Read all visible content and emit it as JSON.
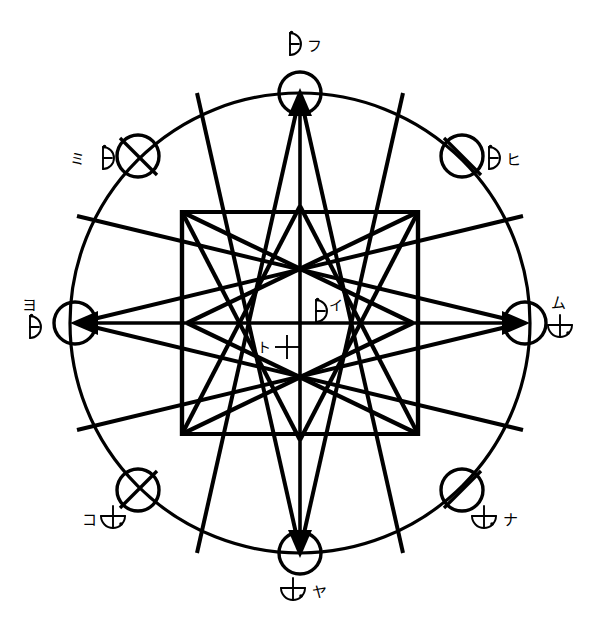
{
  "figure": {
    "style": {
      "ink_color": "#000000",
      "background_color": "#ffffff"
    },
    "geometry": {
      "center_x": 300,
      "center_y": 323,
      "outer_radius": 230,
      "node_radius": 21,
      "star_outer_radius": 153,
      "star_point_count": 8
    }
  },
  "nodes": [
    {
      "id": "north",
      "position": "top",
      "angle_deg": 90,
      "cx": 300,
      "cy": 93,
      "has_arrow": true,
      "arrow_direction": "up",
      "line_through": false,
      "label": {
        "symbol": "half-moon-with-dot",
        "kana": "フ",
        "order": "symbol-then-kana",
        "x": 300,
        "y": 42
      }
    },
    {
      "id": "northeast",
      "position": "upper-right",
      "angle_deg": 45,
      "cx": 462,
      "cy": 156,
      "has_arrow": false,
      "arrow_direction": null,
      "line_through": true,
      "label": {
        "symbol": "half-moon-with-dot",
        "kana": "ヒ",
        "order": "symbol-then-kana",
        "x": 500,
        "y": 158
      }
    },
    {
      "id": "east",
      "position": "right",
      "angle_deg": 0,
      "cx": 525,
      "cy": 323,
      "has_arrow": true,
      "arrow_direction": "right",
      "line_through": false,
      "label": {
        "symbol": "cup-with-dot",
        "kana": "ム",
        "order": "kana-above-symbol",
        "x": 560,
        "y": 310
      }
    },
    {
      "id": "southeast",
      "position": "lower-right",
      "angle_deg": -45,
      "cx": 462,
      "cy": 490,
      "has_arrow": false,
      "arrow_direction": null,
      "line_through": true,
      "label": {
        "symbol": "cup-with-dot",
        "kana": "ナ",
        "order": "symbol-then-kana",
        "x": 492,
        "y": 522
      }
    },
    {
      "id": "south",
      "position": "bottom",
      "angle_deg": -90,
      "cx": 300,
      "cy": 553,
      "has_arrow": true,
      "arrow_direction": "down",
      "line_through": false,
      "label": {
        "symbol": "cup-with-dot",
        "kana": "ヤ",
        "order": "symbol-then-kana",
        "x": 300,
        "y": 592
      }
    },
    {
      "id": "southwest",
      "position": "lower-left",
      "angle_deg": -135,
      "cx": 138,
      "cy": 490,
      "has_arrow": false,
      "arrow_direction": null,
      "line_through": true,
      "label": {
        "symbol": "cup-with-dot",
        "kana": "コ",
        "order": "kana-then-symbol",
        "x": 90,
        "y": 522
      }
    },
    {
      "id": "west",
      "position": "left",
      "angle_deg": 180,
      "cx": 75,
      "cy": 323,
      "has_arrow": true,
      "arrow_direction": "left",
      "line_through": false,
      "label": {
        "symbol": "half-moon-with-dot",
        "kana": "ヨ",
        "order": "kana-above-symbol",
        "x": 30,
        "y": 310
      }
    },
    {
      "id": "northwest",
      "position": "upper-left",
      "angle_deg": 135,
      "cx": 138,
      "cy": 156,
      "has_arrow": false,
      "arrow_direction": null,
      "line_through": true,
      "label": {
        "symbol": "half-moon-with-dot",
        "kana": "ミ",
        "order": "kana-then-symbol",
        "x": 78,
        "y": 158
      }
    }
  ],
  "center_labels": [
    {
      "id": "center-upper",
      "symbol": "half-moon-with-dot",
      "kana": "イ",
      "order": "symbol-then-kana",
      "x": 318,
      "y": 309
    },
    {
      "id": "center-lower",
      "symbol": "cross-plus",
      "kana": "ト",
      "order": "kana-then-symbol",
      "x": 262,
      "y": 348
    }
  ],
  "legend": {
    "symbols": [
      {
        "name": "half-moon-with-dot",
        "description": "Vertical bar with right-facing semicircle and small dot at top"
      },
      {
        "name": "cup-with-dot",
        "description": "Vertical bar through a downward bowl with a small dot"
      },
      {
        "name": "cross-plus",
        "description": "Equal-armed cross / plus sign"
      }
    ],
    "kana_sequence": [
      "フ",
      "ヒ",
      "ム",
      "ナ",
      "ヤ",
      "コ",
      "ヨ",
      "ミ",
      "イ",
      "ト"
    ]
  }
}
